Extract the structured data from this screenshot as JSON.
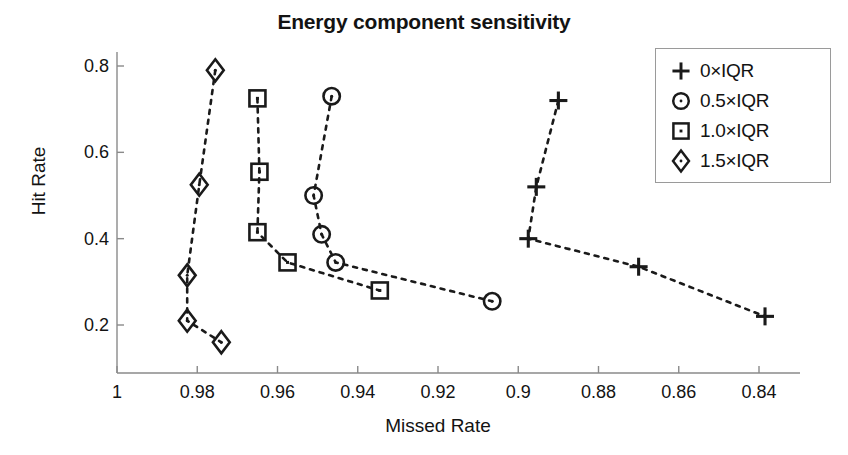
{
  "chart_data": {
    "type": "scatter",
    "title": "Energy component sensitivity",
    "xlabel": "Missed Rate",
    "ylabel": "Hit Rate",
    "xlim": [
      1.0,
      0.832
    ],
    "ylim": [
      0.12,
      0.83
    ],
    "x_ticks": [
      "1",
      "0.98",
      "0.96",
      "0.94",
      "0.92",
      "0.9",
      "0.88",
      "0.86",
      "0.84"
    ],
    "x_tick_values": [
      1.0,
      0.98,
      0.96,
      0.94,
      0.92,
      0.9,
      0.88,
      0.86,
      0.84
    ],
    "y_ticks": [
      "0.2",
      "0.4",
      "0.6",
      "0.8"
    ],
    "y_tick_values": [
      0.2,
      0.4,
      0.6,
      0.8
    ],
    "grid": false,
    "x_axis_reversed": true,
    "legend_position": "top-right",
    "line_style": "dotted",
    "series": [
      {
        "name": "0×IQR",
        "marker": "plus",
        "x": [
          0.89,
          0.8955,
          0.8975,
          0.87,
          0.8385
        ],
        "y": [
          0.72,
          0.52,
          0.4,
          0.335,
          0.22
        ]
      },
      {
        "name": "0.5×IQR",
        "marker": "circle",
        "x": [
          0.9465,
          0.951,
          0.949,
          0.9455,
          0.9065
        ],
        "y": [
          0.73,
          0.5,
          0.41,
          0.345,
          0.255
        ]
      },
      {
        "name": "1.0×IQR",
        "marker": "square",
        "x": [
          0.965,
          0.9645,
          0.965,
          0.9575,
          0.9345
        ],
        "y": [
          0.725,
          0.555,
          0.415,
          0.345,
          0.28
        ]
      },
      {
        "name": "1.5×IQR",
        "marker": "diamond",
        "x": [
          0.9755,
          0.9795,
          0.9825,
          0.9825,
          0.974
        ],
        "y": [
          0.79,
          0.525,
          0.315,
          0.21,
          0.16
        ]
      }
    ]
  },
  "legend": {
    "entries": [
      {
        "label": "0×IQR",
        "marker": "plus"
      },
      {
        "label": "0.5×IQR",
        "marker": "circle"
      },
      {
        "label": "1.0×IQR",
        "marker": "square"
      },
      {
        "label": "1.5×IQR",
        "marker": "diamond"
      }
    ]
  },
  "colors": {
    "ink": "#1a1a1a",
    "axis": "#8a8a8a",
    "background": "#ffffff"
  }
}
